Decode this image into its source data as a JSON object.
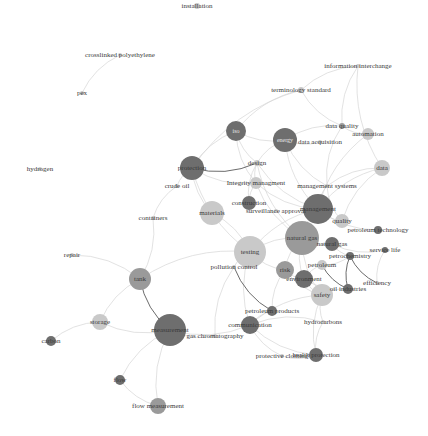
{
  "graph": {
    "title": "keyword co-occurrence network",
    "colors": {
      "dark": "#6e6e6e",
      "mid": "#9a9a9a",
      "light": "#c9c9c9",
      "edge": "#d6d6d6",
      "edge_dark": "#5a5a5a",
      "text": "#3a3a3a"
    },
    "nodes": [
      {
        "id": "installation",
        "label": "installation",
        "x": 197,
        "y": 6,
        "r": 3,
        "shade": "light"
      },
      {
        "id": "crosslinked",
        "label": "crosslinked polyethylene",
        "x": 120,
        "y": 55,
        "r": 2,
        "shade": "light"
      },
      {
        "id": "pex",
        "label": "pex",
        "x": 82,
        "y": 93,
        "r": 2,
        "shade": "light"
      },
      {
        "id": "infointerchange",
        "label": "information interchange",
        "x": 358,
        "y": 66,
        "r": 2,
        "shade": "light"
      },
      {
        "id": "terminology",
        "label": "terminology standard",
        "x": 301,
        "y": 90,
        "r": 3,
        "shade": "light"
      },
      {
        "id": "dataquality",
        "label": "data quality",
        "x": 342,
        "y": 126,
        "r": 3,
        "shade": "mid"
      },
      {
        "id": "automation",
        "label": "automation",
        "x": 368,
        "y": 134,
        "r": 6,
        "shade": "light"
      },
      {
        "id": "iso",
        "label": "iso",
        "x": 236,
        "y": 131,
        "r": 10,
        "shade": "dark"
      },
      {
        "id": "energy",
        "label": "energy",
        "x": 285,
        "y": 140,
        "r": 12,
        "shade": "dark"
      },
      {
        "id": "dataacq",
        "label": "data acquisition",
        "x": 320,
        "y": 142,
        "r": 2,
        "shade": "light"
      },
      {
        "id": "data",
        "label": "data",
        "x": 382,
        "y": 168,
        "r": 8,
        "shade": "light"
      },
      {
        "id": "hydrogen",
        "label": "hydrogen",
        "x": 40,
        "y": 169,
        "r": 2,
        "shade": "light"
      },
      {
        "id": "protection",
        "label": "protection",
        "x": 192,
        "y": 168,
        "r": 12,
        "shade": "dark"
      },
      {
        "id": "design",
        "label": "design",
        "x": 257,
        "y": 163,
        "r": 3,
        "shade": "light"
      },
      {
        "id": "crudeoil",
        "label": "crude oil",
        "x": 177,
        "y": 186,
        "r": 2,
        "shade": "light"
      },
      {
        "id": "integrity",
        "label": "Integrity managment",
        "x": 256,
        "y": 183,
        "r": 6,
        "shade": "light"
      },
      {
        "id": "mgmtsystems",
        "label": "management systems",
        "x": 327,
        "y": 186,
        "r": 2,
        "shade": "light"
      },
      {
        "id": "containers",
        "label": "containers",
        "x": 153,
        "y": 218,
        "r": 2,
        "shade": "light"
      },
      {
        "id": "materials",
        "label": "materials",
        "x": 212,
        "y": 213,
        "r": 12,
        "shade": "light"
      },
      {
        "id": "construction",
        "label": "construction",
        "x": 249,
        "y": 203,
        "r": 7,
        "shade": "dark"
      },
      {
        "id": "surveillance",
        "label": "surveillance approval",
        "x": 276,
        "y": 211,
        "r": 2,
        "shade": "light"
      },
      {
        "id": "management",
        "label": "management",
        "x": 318,
        "y": 209,
        "r": 15,
        "shade": "dark"
      },
      {
        "id": "quality",
        "label": "quality",
        "x": 342,
        "y": 221,
        "r": 7,
        "shade": "light"
      },
      {
        "id": "petroltech",
        "label": "petroleum technology",
        "x": 378,
        "y": 230,
        "r": 4,
        "shade": "dark"
      },
      {
        "id": "naturalgas_big",
        "label": "natural gas",
        "x": 302,
        "y": 238,
        "r": 17,
        "shade": "mid"
      },
      {
        "id": "naturalgas",
        "label": "natural gas",
        "x": 332,
        "y": 244,
        "r": 7,
        "shade": "dark"
      },
      {
        "id": "servicelife",
        "label": "service life",
        "x": 385,
        "y": 250,
        "r": 3,
        "shade": "dark"
      },
      {
        "id": "testing",
        "label": "testing",
        "x": 250,
        "y": 252,
        "r": 16,
        "shade": "light"
      },
      {
        "id": "petrochem",
        "label": "petrochemistry",
        "x": 350,
        "y": 256,
        "r": 4,
        "shade": "dark"
      },
      {
        "id": "repair",
        "label": "repair",
        "x": 72,
        "y": 255,
        "r": 2,
        "shade": "light"
      },
      {
        "id": "petroleum",
        "label": "petroleum",
        "x": 322,
        "y": 265,
        "r": 5,
        "shade": "light"
      },
      {
        "id": "pollution",
        "label": "pollution control",
        "x": 234,
        "y": 267,
        "r": 2,
        "shade": "light"
      },
      {
        "id": "risk",
        "label": "risk",
        "x": 285,
        "y": 270,
        "r": 9,
        "shade": "mid"
      },
      {
        "id": "efficiency",
        "label": "efficiency",
        "x": 377,
        "y": 283,
        "r": 2,
        "shade": "light"
      },
      {
        "id": "environment",
        "label": "environment",
        "x": 304,
        "y": 279,
        "r": 9,
        "shade": "dark"
      },
      {
        "id": "oilind",
        "label": "oil industries",
        "x": 348,
        "y": 289,
        "r": 5,
        "shade": "dark"
      },
      {
        "id": "tank",
        "label": "tank",
        "x": 140,
        "y": 279,
        "r": 11,
        "shade": "mid"
      },
      {
        "id": "safety",
        "label": "safety",
        "x": 322,
        "y": 295,
        "r": 11,
        "shade": "light"
      },
      {
        "id": "petrolproducts",
        "label": "petroleum products",
        "x": 272,
        "y": 311,
        "r": 5,
        "shade": "dark"
      },
      {
        "id": "hydrocarbons",
        "label": "hydrocarbons",
        "x": 323,
        "y": 322,
        "r": 2,
        "shade": "light"
      },
      {
        "id": "storage",
        "label": "storage",
        "x": 100,
        "y": 322,
        "r": 8,
        "shade": "light"
      },
      {
        "id": "measurement",
        "label": "measurement",
        "x": 170,
        "y": 330,
        "r": 16,
        "shade": "dark"
      },
      {
        "id": "communication",
        "label": "communication",
        "x": 250,
        "y": 325,
        "r": 9,
        "shade": "dark"
      },
      {
        "id": "gaschrom",
        "label": "gas chromatography",
        "x": 215,
        "y": 336,
        "r": 2,
        "shade": "light"
      },
      {
        "id": "carbon",
        "label": "carbon",
        "x": 51,
        "y": 341,
        "r": 5,
        "shade": "dark"
      },
      {
        "id": "protclothing",
        "label": "protective clothing",
        "x": 282,
        "y": 356,
        "r": 2,
        "shade": "light"
      },
      {
        "id": "healthprot",
        "label": "health protection",
        "x": 316,
        "y": 355,
        "r": 7,
        "shade": "dark"
      },
      {
        "id": "flow",
        "label": "flow",
        "x": 120,
        "y": 380,
        "r": 5,
        "shade": "dark"
      },
      {
        "id": "flowmeas",
        "label": "flow measurement",
        "x": 158,
        "y": 406,
        "r": 8,
        "shade": "mid"
      }
    ],
    "edges": [
      [
        "crosslinked",
        "pex",
        0
      ],
      [
        "infointerchange",
        "terminology",
        0
      ],
      [
        "infointerchange",
        "dataquality",
        0
      ],
      [
        "infointerchange",
        "data",
        0
      ],
      [
        "terminology",
        "dataquality",
        0
      ],
      [
        "terminology",
        "protection",
        0
      ],
      [
        "terminology",
        "iso",
        0
      ],
      [
        "dataquality",
        "automation",
        0
      ],
      [
        "dataquality",
        "mgmtsystems",
        0
      ],
      [
        "dataquality",
        "energy",
        0
      ],
      [
        "iso",
        "energy",
        0
      ],
      [
        "iso",
        "design",
        0
      ],
      [
        "iso",
        "protection",
        0
      ],
      [
        "iso",
        "integrity",
        0
      ],
      [
        "energy",
        "design",
        0
      ],
      [
        "energy",
        "dataacq",
        0
      ],
      [
        "energy",
        "management",
        0
      ],
      [
        "energy",
        "mgmtsystems",
        0
      ],
      [
        "data",
        "mgmtsystems",
        0
      ],
      [
        "data",
        "management",
        0
      ],
      [
        "data",
        "quality",
        0
      ],
      [
        "automation",
        "management",
        0
      ],
      [
        "protection",
        "design",
        1
      ],
      [
        "protection",
        "crudeoil",
        0
      ],
      [
        "protection",
        "materials",
        0
      ],
      [
        "protection",
        "integrity",
        0
      ],
      [
        "protection",
        "testing",
        0
      ],
      [
        "crudeoil",
        "containers",
        0
      ],
      [
        "design",
        "integrity",
        0
      ],
      [
        "design",
        "management",
        0
      ],
      [
        "design",
        "construction",
        0
      ],
      [
        "design",
        "naturalgas_big",
        0
      ],
      [
        "integrity",
        "construction",
        0
      ],
      [
        "integrity",
        "management",
        0
      ],
      [
        "integrity",
        "naturalgas_big",
        0
      ],
      [
        "mgmtsystems",
        "management",
        0
      ],
      [
        "mgmtsystems",
        "quality",
        0
      ],
      [
        "management",
        "naturalgas_big",
        0
      ],
      [
        "management",
        "quality",
        0
      ],
      [
        "management",
        "testing",
        0
      ],
      [
        "management",
        "petroltech",
        0
      ],
      [
        "naturalgas_big",
        "naturalgas",
        0
      ],
      [
        "naturalgas_big",
        "testing",
        0
      ],
      [
        "naturalgas_big",
        "risk",
        0
      ],
      [
        "naturalgas_big",
        "safety",
        0
      ],
      [
        "naturalgas_big",
        "environment",
        0
      ],
      [
        "naturalgas",
        "servicelife",
        0
      ],
      [
        "naturalgas",
        "petrochem",
        0
      ],
      [
        "petrochem",
        "oilind",
        1
      ],
      [
        "petrochem",
        "efficiency",
        1
      ],
      [
        "petroleum",
        "oilind",
        1
      ],
      [
        "servicelife",
        "efficiency",
        0
      ],
      [
        "petroleum",
        "petrochem",
        0
      ],
      [
        "petroleum",
        "environment",
        0
      ],
      [
        "testing",
        "pollution",
        0
      ],
      [
        "testing",
        "materials",
        0
      ],
      [
        "testing",
        "tank",
        0
      ],
      [
        "testing",
        "risk",
        0
      ],
      [
        "testing",
        "communication",
        0
      ],
      [
        "pollution",
        "petrolproducts",
        1
      ],
      [
        "pollution",
        "gaschrom",
        0
      ],
      [
        "risk",
        "environment",
        0
      ],
      [
        "risk",
        "safety",
        0
      ],
      [
        "risk",
        "petrolproducts",
        0
      ],
      [
        "environment",
        "safety",
        0
      ],
      [
        "environment",
        "oilind",
        0
      ],
      [
        "safety",
        "hydrocarbons",
        0
      ],
      [
        "safety",
        "communication",
        0
      ],
      [
        "safety",
        "healthprot",
        0
      ],
      [
        "hydrocarbons",
        "communication",
        0
      ],
      [
        "hydrocarbons",
        "healthprot",
        0
      ],
      [
        "communication",
        "protclothing",
        0
      ],
      [
        "communication",
        "healthprot",
        0
      ],
      [
        "petrolproducts",
        "communication",
        0
      ],
      [
        "tank",
        "measurement",
        1
      ],
      [
        "tank",
        "storage",
        0
      ],
      [
        "tank",
        "repair",
        0
      ],
      [
        "tank",
        "containers",
        0
      ],
      [
        "storage",
        "measurement",
        0
      ],
      [
        "storage",
        "carbon",
        0
      ],
      [
        "measurement",
        "gaschrom",
        0
      ],
      [
        "measurement",
        "communication",
        0
      ],
      [
        "measurement",
        "flow",
        0
      ],
      [
        "measurement",
        "flowmeas",
        0
      ],
      [
        "flow",
        "flowmeas",
        0
      ],
      [
        "protclothing",
        "healthprot",
        0
      ]
    ]
  }
}
